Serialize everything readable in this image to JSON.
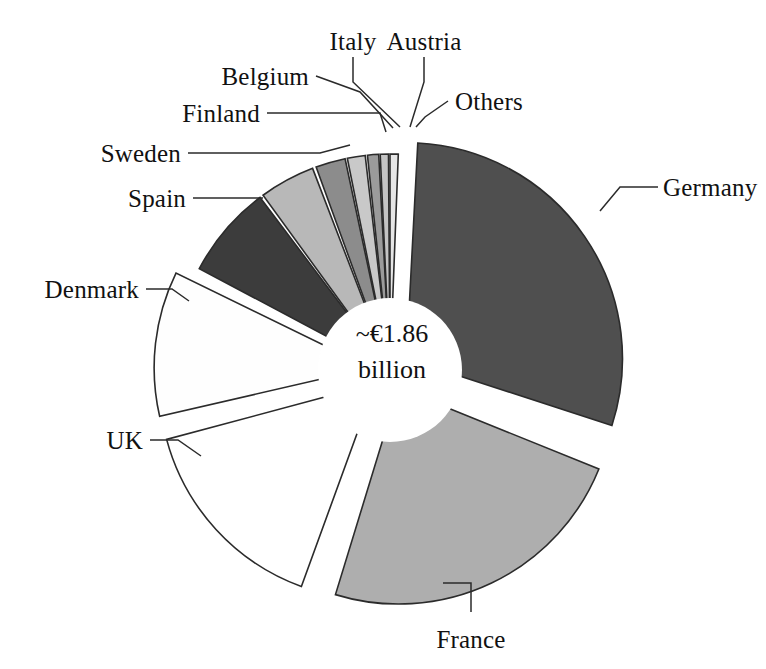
{
  "chart_data": {
    "type": "pie",
    "title": "",
    "subtitle": "",
    "center_label_line1": "~€1.86",
    "center_label_line2": "billion",
    "total_label": "~€1.86 billion",
    "legend_position": "callout-labels",
    "grid": false,
    "donut": true,
    "categories": [
      "Germany",
      "France",
      "UK",
      "Denmark",
      "Spain",
      "Sweden",
      "Finland",
      "Belgium",
      "Italy",
      "Austria",
      "Others"
    ],
    "values": [
      29.2,
      23.6,
      15.3,
      10.8,
      7.0,
      4.2,
      2.6,
      1.9,
      1.4,
      1.1,
      2.9
    ],
    "unit": "percent",
    "series": [
      {
        "name": "Share of €1.86 billion",
        "values": [
          29.2,
          23.6,
          15.3,
          10.8,
          7.0,
          4.2,
          2.6,
          1.9,
          1.4,
          1.1,
          2.9
        ]
      }
    ],
    "slices": [
      {
        "label": "Germany",
        "value": 29.2,
        "color": "#4f4f4f",
        "start_deg": 3,
        "end_deg": 108,
        "exploded": true
      },
      {
        "label": "France",
        "value": 23.6,
        "color": "#aeaeae",
        "start_deg": 112,
        "end_deg": 197,
        "exploded": true
      },
      {
        "label": "UK",
        "value": 15.3,
        "color": "#ffffff",
        "start_deg": 200,
        "end_deg": 255,
        "exploded": true
      },
      {
        "label": "Denmark",
        "value": 10.8,
        "color": "#fefefe",
        "start_deg": 257,
        "end_deg": 296,
        "exploded": true
      },
      {
        "label": "Spain",
        "value": 7.0,
        "color": "#3c3c3c",
        "start_deg": 298,
        "end_deg": 323,
        "exploded": false
      },
      {
        "label": "Sweden",
        "value": 4.2,
        "color": "#b8b8b8",
        "start_deg": 324,
        "end_deg": 339,
        "exploded": false
      },
      {
        "label": "Finland",
        "value": 2.6,
        "color": "#8c8c8c",
        "start_deg": 340,
        "end_deg": 348,
        "exploded": false
      },
      {
        "label": "Belgium",
        "value": 1.9,
        "color": "#c9c9c9",
        "start_deg": 348.6,
        "end_deg": 353.4,
        "exploded": false
      },
      {
        "label": "Italy",
        "value": 1.4,
        "color": "#9b9b9b",
        "start_deg": 354,
        "end_deg": 357,
        "exploded": false
      },
      {
        "label": "Austria",
        "value": 1.1,
        "color": "#c4c4c4",
        "start_deg": 357.4,
        "end_deg": 359.6,
        "exploded": false
      },
      {
        "label": "Others",
        "value": 2.9,
        "color": "#e6e6e6",
        "start_deg": 360,
        "end_deg": 362.2,
        "exploded": false
      }
    ]
  },
  "labels": {
    "germany": "Germany",
    "france": "France",
    "uk": "UK",
    "denmark": "Denmark",
    "spain": "Spain",
    "sweden": "Sweden",
    "finland": "Finland",
    "belgium": "Belgium",
    "italy": "Italy",
    "austria": "Austria",
    "others": "Others"
  },
  "center": {
    "line1": "~€1.86",
    "line2": "billion"
  },
  "colors": {
    "germany": "#4f4f4f",
    "france": "#aeaeae",
    "uk": "#ffffff",
    "denmark": "#fefefe",
    "spain": "#3c3c3c",
    "sweden": "#b8b8b8",
    "finland": "#8c8c8c",
    "belgium": "#c9c9c9",
    "italy": "#9b9b9b",
    "austria": "#c4c4c4",
    "others": "#e6e6e6",
    "outline": "#2b2b2b",
    "background": "#ffffff",
    "text": "#111111"
  }
}
